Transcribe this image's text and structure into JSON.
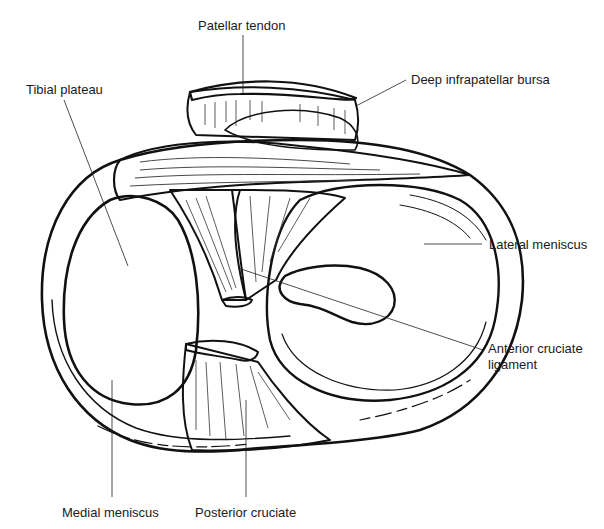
{
  "figure": {
    "colors": {
      "ink": "#111111",
      "shade": "#e6e6e6",
      "shade_light": "#f0f0f0",
      "background": "#ffffff",
      "label_text": "#1a1a1a"
    }
  },
  "labels": {
    "patellar_tendon": {
      "text": "Patellar tendon",
      "x": 260,
      "y": 18,
      "leader": [
        [
          243,
          35
        ],
        [
          243,
          94
        ]
      ]
    },
    "deep_infrapatellar_bursa": {
      "text": "Deep infrapatellar bursa",
      "x": 411,
      "y": 72,
      "leader": [
        [
          406,
          80
        ],
        [
          356,
          106
        ]
      ]
    },
    "tibial_plateau": {
      "text": "Tibial plateau",
      "x": 26,
      "y": 82,
      "leader": [
        [
          64,
          100
        ],
        [
          128,
          266
        ]
      ]
    },
    "lateral_meniscus": {
      "text": "Lateral meniscus",
      "x": 489,
      "y": 237,
      "leader": [
        [
          482,
          244
        ],
        [
          424,
          244
        ]
      ]
    },
    "anterior_cruciate_ligament": {
      "text": "Anterior cruciate",
      "text2": "ligament",
      "x": 488,
      "y": 341,
      "leader": [
        [
          483,
          350
        ],
        [
          238,
          268
        ]
      ]
    },
    "medial_meniscus": {
      "text": "Medial meniscus",
      "x": 62,
      "y": 505,
      "leader": [
        [
          112,
          497
        ],
        [
          112,
          380
        ]
      ]
    },
    "posterior_cruciate": {
      "text": "Posterior cruciate",
      "x": 195,
      "y": 505,
      "leader": [
        [
          246,
          497
        ],
        [
          246,
          400
        ]
      ]
    }
  }
}
